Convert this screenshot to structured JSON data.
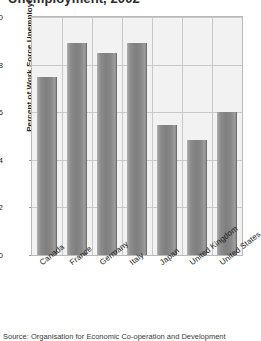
{
  "chart_data": {
    "type": "bar",
    "title": "Unemployment, 2002",
    "title_note": "cropped-at-top-edge",
    "xlabel": "",
    "ylabel": "Percent of Work Force Unemployed",
    "categories": [
      "Canada",
      "France",
      "Germany",
      "Italy",
      "Japan",
      "United Kingdom",
      "United States"
    ],
    "values": [
      7.5,
      8.9,
      8.5,
      8.9,
      5.45,
      4.85,
      6.0
    ],
    "ylim": [
      0,
      10
    ],
    "yticks": [
      0,
      2,
      4,
      6,
      8,
      10
    ],
    "ytick_labels": [
      "0",
      "2",
      "4",
      "6",
      "8",
      "10"
    ],
    "grid": "horizontal-and-vertical",
    "legend": "none",
    "bar_color": "#8b8b8b",
    "plot_background": "#f2f2f2",
    "gridline_color": "#c9c9c9",
    "frame_color": "#b9b9b9"
  },
  "source_note": "Source: Organisation for Economic Co-operation and Development",
  "colors": {
    "bar": "#8b8b8b",
    "plot_bg": "#f2f2f2",
    "grid": "#c9c9c9",
    "frame": "#b9b9b9",
    "text": "#1a1a1a",
    "page_bg": "#ffffff"
  }
}
